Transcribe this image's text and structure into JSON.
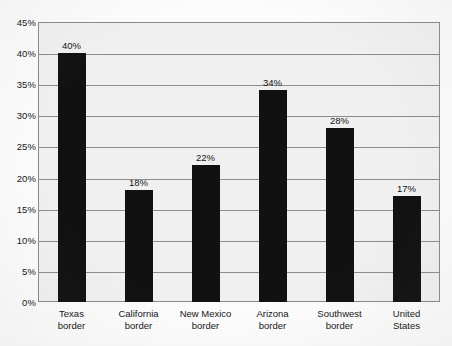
{
  "chart_data": {
    "type": "bar",
    "title": "",
    "subtitle": "",
    "xlabel": "",
    "ylabel": "",
    "categories": [
      "Texas border",
      "California border",
      "New Mexico border",
      "Arizona border",
      "Southwest border",
      "United States"
    ],
    "category_lines": [
      [
        "Texas",
        "border"
      ],
      [
        "California",
        "border"
      ],
      [
        "New Mexico",
        "border"
      ],
      [
        "Arizona",
        "border"
      ],
      [
        "Southwest",
        "border"
      ],
      [
        "United",
        "States"
      ]
    ],
    "values": [
      40,
      18,
      22,
      34,
      28,
      17
    ],
    "data_labels": [
      "40%",
      "18%",
      "22%",
      "34%",
      "28%",
      "17%"
    ],
    "ylim": [
      0,
      45
    ],
    "ytick_values": [
      0,
      5,
      10,
      15,
      20,
      25,
      30,
      35,
      40,
      45
    ],
    "ytick_labels": [
      "0%",
      "5%",
      "10%",
      "15%",
      "20%",
      "25%",
      "30%",
      "35%",
      "40%",
      "45%"
    ],
    "grid": true,
    "grid_axis": "y",
    "legend": false,
    "legend_position": "none",
    "bar_color": "#111111",
    "plot_background": "#f1f1f1",
    "gridline_color": "#8d8d8d",
    "axis_color": "#8a8a8a",
    "text_color": "#151515"
  }
}
